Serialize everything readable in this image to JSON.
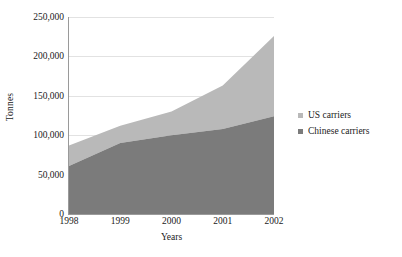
{
  "chart_data": {
    "type": "area",
    "stacked": true,
    "title": "",
    "xlabel": "Years",
    "ylabel": "Tonnes",
    "categories": [
      "1998",
      "1999",
      "2000",
      "2001",
      "2002"
    ],
    "x": [
      1998,
      1999,
      2000,
      2001,
      2002
    ],
    "ylim": [
      0,
      250000
    ],
    "ytick_values": [
      0,
      50000,
      100000,
      150000,
      200000,
      250000
    ],
    "ytick_labels": [
      "0",
      "50,000",
      "100,000",
      "150,000",
      "200,000",
      "250,000"
    ],
    "grid": true,
    "legend_position": "right",
    "series": [
      {
        "name": "Chinese carriers",
        "color": "#7b7b7b",
        "values": [
          61000,
          90000,
          100000,
          108000,
          124000
        ]
      },
      {
        "name": "US carriers",
        "color": "#b9b9b9",
        "values": [
          26000,
          22000,
          30000,
          55000,
          102000
        ]
      }
    ],
    "stack_totals": [
      87000,
      112000,
      130000,
      163000,
      226000
    ],
    "legend_order": [
      "US carriers",
      "Chinese carriers"
    ]
  },
  "axes": {
    "y_title": "Tonnes",
    "x_title": "Years"
  },
  "colors": {
    "us_carriers": "#b9b9b9",
    "chinese_carriers": "#7b7b7b",
    "gridline": "#e2e2e2",
    "axis": "#9a9a9a",
    "text": "#1a1a1a",
    "background": "#ffffff"
  }
}
